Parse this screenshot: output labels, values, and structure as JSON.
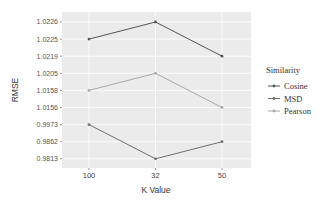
{
  "chart_data": {
    "type": "line",
    "title": "",
    "xlabel": "K Value",
    "ylabel": "RMSE",
    "categories": [
      "100",
      "32",
      "50"
    ],
    "y_ticks": [
      "1.0226",
      "1.0225",
      "1.0219",
      "1.0205",
      "1.0158",
      "1.0156",
      "0.9973",
      "0.9862",
      "0.9813"
    ],
    "y_axis_type": "discrete-descending",
    "grid": true,
    "legend": {
      "title": "Similarity",
      "position": "right"
    },
    "series": [
      {
        "name": "Cosine",
        "values": [
          1.0225,
          1.0226,
          1.0219
        ],
        "color": "#555555"
      },
      {
        "name": "MSD",
        "values": [
          0.9973,
          0.9813,
          0.9862
        ],
        "color": "#6e6e6e"
      },
      {
        "name": "Pearson",
        "values": [
          1.0158,
          1.0205,
          1.0156
        ],
        "color": "#a8a8a8"
      }
    ],
    "panel_background": "#ebebeb"
  }
}
